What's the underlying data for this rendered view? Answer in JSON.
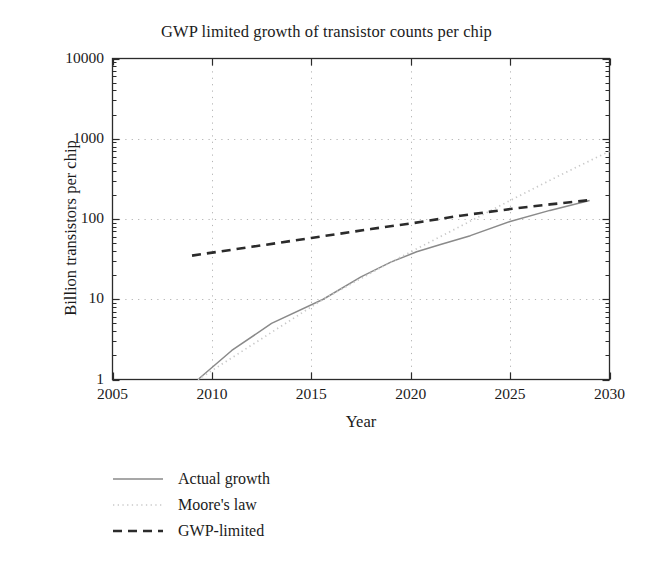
{
  "chart_data": {
    "type": "line",
    "title": "GWP limited growth of transistor counts per chip",
    "xlabel": "Year",
    "ylabel": "Billion transistors per chip",
    "xlim": [
      2005,
      2030
    ],
    "ylim": [
      1,
      10000
    ],
    "yscale": "log",
    "xticks": [
      2005,
      2010,
      2015,
      2020,
      2025,
      2030
    ],
    "xtick_labels": [
      "2005",
      "2010",
      "2015",
      "2020",
      "2025",
      "2030"
    ],
    "yticks": [
      1,
      10,
      100,
      1000,
      10000
    ],
    "ytick_labels": [
      "1",
      "10",
      "100",
      "1000",
      "10000"
    ],
    "grid": "dotted gridlines at major ticks, both axes",
    "legend_position": "below plot, lower left",
    "series": [
      {
        "name": "Actual growth",
        "style": "solid",
        "color": "#8a8a8a",
        "points": [
          [
            2009.3,
            1.0
          ],
          [
            2011.0,
            2.3
          ],
          [
            2013.0,
            5.0
          ],
          [
            2015.6,
            10.0
          ],
          [
            2017.5,
            19.0
          ],
          [
            2019.0,
            29.0
          ],
          [
            2020.3,
            39.0
          ],
          [
            2021.5,
            48.0
          ],
          [
            2023.0,
            62.0
          ],
          [
            2025.0,
            93.0
          ],
          [
            2027.0,
            128.0
          ],
          [
            2029.0,
            170.0
          ]
        ]
      },
      {
        "name": "Moore's law",
        "style": "dotted",
        "color": "#c9c9c9",
        "points": [
          [
            2009.3,
            1.0
          ],
          [
            2015.6,
            10.0
          ],
          [
            2019.0,
            29.0
          ],
          [
            2022.0,
            70.0
          ],
          [
            2025.0,
            170.0
          ],
          [
            2027.5,
            350.0
          ],
          [
            2030.0,
            700.0
          ]
        ]
      },
      {
        "name": "GWP-limited",
        "style": "dashed",
        "color": "#2b2b2b",
        "points": [
          [
            2009.0,
            35.0
          ],
          [
            2012.0,
            45.0
          ],
          [
            2015.0,
            58.0
          ],
          [
            2018.0,
            75.0
          ],
          [
            2020.0,
            88.0
          ],
          [
            2022.5,
            110.0
          ],
          [
            2025.0,
            133.0
          ],
          [
            2027.0,
            152.0
          ],
          [
            2029.0,
            172.0
          ]
        ]
      }
    ]
  },
  "legend": {
    "items": [
      {
        "label": "Actual growth",
        "style": "solid"
      },
      {
        "label": "Moore's law",
        "style": "dotted"
      },
      {
        "label": "GWP-limited",
        "style": "dashed"
      }
    ]
  },
  "colors": {
    "actual": "#8a8a8a",
    "moores": "#c9c9c9",
    "gwp": "#2b2b2b",
    "axis": "#2b2b2b",
    "grid": "#b4b4b4",
    "text": "#1b1b1b"
  }
}
